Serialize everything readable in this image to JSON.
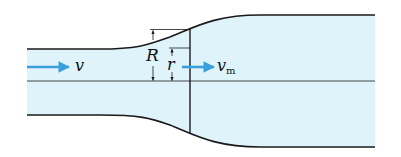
{
  "diagram": {
    "type": "pipe-flow-widening",
    "colors": {
      "fluid_fill": "#dff3fa",
      "outline": "#1a1a1a",
      "arrow": "#3aa0dd"
    },
    "labels": {
      "inlet_velocity": "v",
      "mean_velocity_main": "v",
      "mean_velocity_sub": "m",
      "big_radius": "R",
      "small_radius": "r"
    }
  }
}
